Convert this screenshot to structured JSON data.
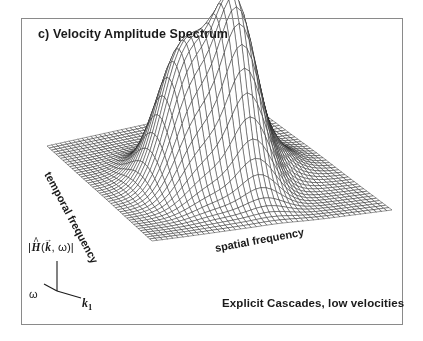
{
  "figure": {
    "panel_title": "c) Velocity Amplitude Spectrum",
    "condition_caption": "Explicit Cascades, low velocities",
    "frame_color": "#8a8a8a",
    "background_color": "#ffffff",
    "mesh_color": "#1a1a1a"
  },
  "axes": {
    "spatial_frequency_label": "spatial frequency",
    "temporal_frequency_label": "temporal frequency",
    "amplitude_label_parts": {
      "open_bar": "|",
      "h_symbol": "H",
      "h_accent": "^",
      "paren_open": "(",
      "k_symbol": "k",
      "k_accent": "→",
      "comma": ",",
      "omega_symbol": "ω",
      "paren_close": ")",
      "close_bar": "|"
    },
    "amplitude_label_plain": "|H(k, ω)|",
    "omega_axis_label": "ω",
    "k1_axis_label": "k",
    "k1_axis_subscript": "1"
  },
  "chart_data": {
    "type": "surface",
    "title": "c) Velocity Amplitude Spectrum",
    "xlabel": "spatial frequency",
    "ylabel": "temporal frequency",
    "zlabel": "|H(k, ω)|",
    "annotation": "Explicit Cascades, low velocities",
    "grid": true,
    "legend": false,
    "grid_nx": 46,
    "grid_ny": 46,
    "xlim": [
      -1,
      1
    ],
    "ylim": [
      -1,
      1
    ],
    "zlim": [
      0,
      1
    ],
    "projection": {
      "corner_left": [
        47,
        148
      ],
      "corner_top": [
        248,
        104
      ],
      "corner_right": [
        392,
        212
      ],
      "corner_front": [
        152,
        243
      ],
      "z_scale": 168
    },
    "surface_model": "sum_of_gaussians",
    "peaks": [
      {
        "name": "primary-peak-left",
        "cx": -0.3,
        "cy": 0.12,
        "amplitude": 0.82,
        "sx": 0.2,
        "sy": 0.26
      },
      {
        "name": "primary-peak-right",
        "cx": 0.06,
        "cy": 0.3,
        "amplitude": 0.96,
        "sx": 0.16,
        "sy": 0.22
      },
      {
        "name": "secondary-shoulder",
        "cx": 0.3,
        "cy": 0.1,
        "amplitude": 0.3,
        "sx": 0.16,
        "sy": 0.2
      },
      {
        "name": "ridge-tail-right",
        "cx": 0.52,
        "cy": -0.02,
        "amplitude": 0.12,
        "sx": 0.18,
        "sy": 0.22
      }
    ],
    "baseline": 0.012
  }
}
